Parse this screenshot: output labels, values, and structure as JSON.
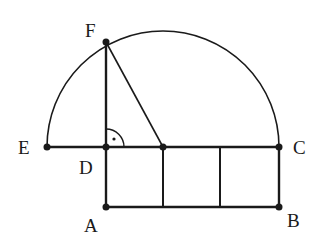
{
  "diagram": {
    "type": "geometry",
    "colors": {
      "stroke": "#1a1a1a",
      "background": "#ffffff"
    },
    "points": {
      "E": {
        "label": "E",
        "x": 47,
        "y": 147
      },
      "D": {
        "label": "D",
        "x": 106,
        "y": 147
      },
      "O": {
        "label": "",
        "x": 163,
        "y": 147
      },
      "P": {
        "label": "",
        "x": 220,
        "y": 147
      },
      "C": {
        "label": "C",
        "x": 279,
        "y": 147
      },
      "A": {
        "label": "A",
        "x": 106,
        "y": 207
      },
      "B": {
        "label": "B",
        "x": 279,
        "y": 207
      },
      "F": {
        "label": "F",
        "x": 106,
        "y": 42
      }
    },
    "labels": {
      "E": "E",
      "D": "D",
      "C": "C",
      "A": "A",
      "B": "B",
      "F": "F"
    },
    "annotations": {
      "right_angle": "right-angle marker at D between DF and DC"
    }
  }
}
